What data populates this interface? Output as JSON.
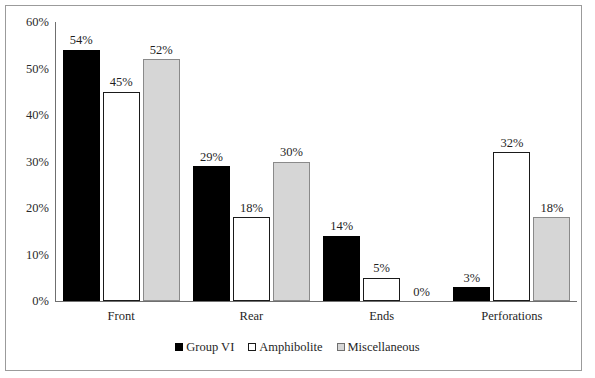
{
  "chart_data": {
    "type": "bar",
    "title": "",
    "subtitle": "",
    "xlabel": "",
    "ylabel": "",
    "categories": [
      "Front",
      "Rear",
      "Ends",
      "Perforations"
    ],
    "series": [
      {
        "name": "Group VI",
        "color": "#000000",
        "values": [
          54,
          29,
          14,
          3
        ],
        "labels": [
          "54%",
          "29%",
          "14%",
          "3%"
        ]
      },
      {
        "name": "Amphibolite",
        "color": "#ffffff",
        "values": [
          45,
          18,
          5,
          32
        ],
        "labels": [
          "45%",
          "18%",
          "5%",
          "32%"
        ]
      },
      {
        "name": "Miscellaneous",
        "color": "#d6d6d6",
        "values": [
          52,
          30,
          0,
          18
        ],
        "labels": [
          "52%",
          "30%",
          "0%",
          "18%"
        ]
      }
    ],
    "ylim": [
      0,
      60
    ],
    "ytick_values": [
      60,
      50,
      40,
      30,
      20,
      10,
      0
    ],
    "ytick_labels": [
      "60%",
      "50%",
      "40%",
      "30%",
      "20%",
      "10%",
      "0%"
    ],
    "grid": false,
    "legend_position": "bottom",
    "data_labels": true
  },
  "legend": {
    "entries": [
      {
        "label": "Group VI",
        "swatch": "black-square-icon"
      },
      {
        "label": "Amphibolite",
        "swatch": "white-square-icon"
      },
      {
        "label": "Miscellaneous",
        "swatch": "gray-square-icon"
      }
    ]
  },
  "colors": {
    "series_group_vi": "#000000",
    "series_amphibolite": "#ffffff",
    "series_miscellaneous": "#d6d6d6",
    "axis": "#6f6f6f",
    "frame": "#9b9b9b",
    "text": "#1f1f1f"
  }
}
